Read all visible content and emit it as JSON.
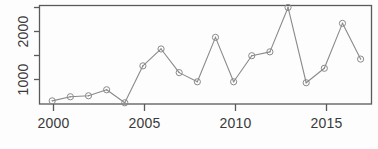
{
  "chart_data": {
    "type": "line",
    "title": "",
    "subtitle": "",
    "xlabel": "",
    "ylabel": "",
    "x": [
      2000,
      2001,
      2002,
      2003,
      2004,
      2005,
      2006,
      2007,
      2008,
      2009,
      2010,
      2011,
      2012,
      2013,
      2014,
      2015,
      2016,
      2017
    ],
    "values": [
      625,
      710,
      730,
      855,
      585,
      1350,
      1700,
      1210,
      1020,
      1940,
      1020,
      1560,
      1640,
      2560,
      1000,
      1300,
      2230,
      1490
    ],
    "series": [
      {
        "name": "",
        "values": [
          625,
          710,
          730,
          855,
          585,
          1350,
          1700,
          1210,
          1020,
          1940,
          1020,
          1560,
          1640,
          2560,
          1000,
          1300,
          2230,
          1490
        ]
      }
    ],
    "xlim": [
      1999.3,
      2017.6
    ],
    "ylim": [
      560,
      2600
    ],
    "x_ticks": [
      2000,
      2005,
      2010,
      2015
    ],
    "x_tick_labels": [
      "2000",
      "2005",
      "2010",
      "2015"
    ],
    "y_ticks": [
      1000,
      1500,
      2000,
      2500
    ],
    "y_tick_labels": [
      "1000",
      "",
      "2000",
      ""
    ],
    "y_labeled_ticks": [
      1000,
      2000
    ],
    "grid": false,
    "legend": null,
    "legend_position": "none",
    "marker": "open-circle-with-dot",
    "line_color": "#8a8a8a",
    "marker_color": "#8a8a8a",
    "axis_color": "#5a5a5a",
    "frame": "box",
    "annotations": []
  },
  "axis": {
    "y_label_1000": "1000",
    "y_label_2000": "2000",
    "x_label_2000": "2000",
    "x_label_2005": "2005",
    "x_label_2010": "2010",
    "x_label_2015": "2015"
  }
}
